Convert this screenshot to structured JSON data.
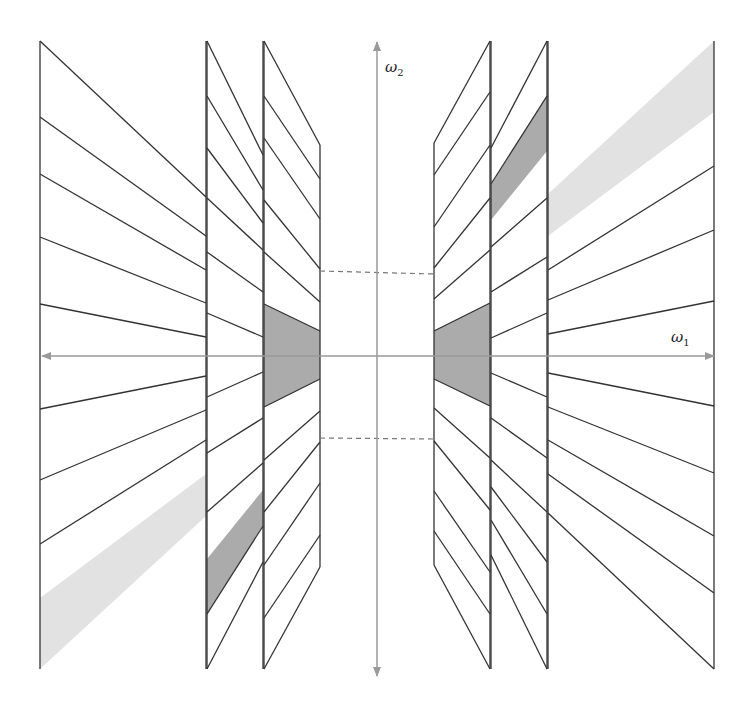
{
  "figure": {
    "axes": {
      "x_label": "ω",
      "x_sub": "1",
      "y_label": "ω",
      "y_sub": "2",
      "axis_color": "#9a9a9a"
    },
    "colors": {
      "line": "#333333",
      "dark_fill": "#ababab",
      "light_fill": "#e2e2e2",
      "dashed": "#777777"
    },
    "center": [
      377,
      355
    ],
    "regions": [
      {
        "name": "outer-left-column",
        "x": [
          40,
          206
        ]
      },
      {
        "name": "middle-left-column",
        "x": [
          207,
          263
        ]
      },
      {
        "name": "inner-left-column",
        "x": [
          264,
          320
        ]
      },
      {
        "name": "inner-right-column",
        "x": [
          434,
          490
        ]
      },
      {
        "name": "middle-right-column",
        "x": [
          491,
          547
        ]
      },
      {
        "name": "outer-right-column",
        "x": [
          548,
          714
        ]
      }
    ]
  }
}
